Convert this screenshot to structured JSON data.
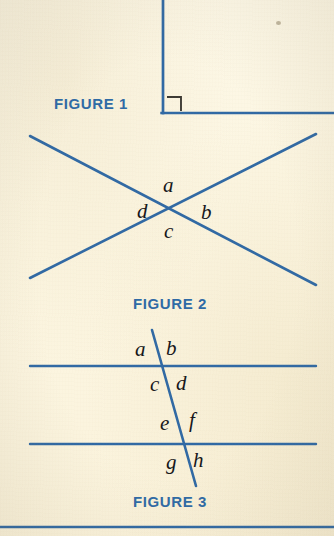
{
  "page": {
    "background_color": "#fdf7e4",
    "ink_color": "#2e6aa6",
    "label_color": "#15161a",
    "right_angle_mark_color": "#3c3a34"
  },
  "figures": [
    {
      "id": "figure-1",
      "caption": "FIGURE 1",
      "description": "A vertical ray meeting a horizontal ray at a right angle, marked with a small square.",
      "caption_position": {
        "x": 54,
        "y": 95
      },
      "elements": {
        "vertical_line": {
          "x1": 163,
          "y1": 0,
          "x2": 163,
          "y2": 113
        },
        "horizontal_line": {
          "x1": 163,
          "y1": 113,
          "x2": 334,
          "y2": 113
        },
        "right_angle_mark": {
          "x": 167,
          "y": 96,
          "size": 14
        }
      },
      "angle_labels": []
    },
    {
      "id": "figure-2",
      "caption": "FIGURE 2",
      "description": "Two straight lines crossing at a point, forming four angles labelled a, b, c and d.",
      "caption_position": {
        "x": 172,
        "y": 303
      },
      "elements": {
        "line_1": {
          "x1": 30,
          "y1": 136,
          "x2": 316,
          "y2": 285
        },
        "line_2": {
          "x1": 30,
          "y1": 278,
          "x2": 316,
          "y2": 134
        },
        "intersection": {
          "x": 172,
          "y": 211
        }
      },
      "angle_labels": [
        {
          "text": "a",
          "x": 168,
          "y": 186
        },
        {
          "text": "b",
          "x": 206,
          "y": 213
        },
        {
          "text": "c",
          "x": 169,
          "y": 232
        },
        {
          "text": "d",
          "x": 143,
          "y": 212
        }
      ]
    },
    {
      "id": "figure-3",
      "caption": "FIGURE 3",
      "description": "Two parallel lines cut by a transversal, forming eight angles labelled a through h.",
      "caption_position": {
        "x": 172,
        "y": 501
      },
      "elements": {
        "parallel_line_top": {
          "x1": 30,
          "y1": 366,
          "x2": 316,
          "y2": 366
        },
        "parallel_line_bottom": {
          "x1": 30,
          "y1": 444,
          "x2": 316,
          "y2": 444
        },
        "transversal": {
          "x1": 152,
          "y1": 330,
          "x2": 196,
          "y2": 486
        }
      },
      "angle_labels": [
        {
          "text": "a",
          "x": 141,
          "y": 350
        },
        {
          "text": "b",
          "x": 171,
          "y": 349
        },
        {
          "text": "c",
          "x": 156,
          "y": 385
        },
        {
          "text": "d",
          "x": 181,
          "y": 384
        },
        {
          "text": "e",
          "x": 165,
          "y": 423
        },
        {
          "text": "f",
          "x": 192,
          "y": 421
        },
        {
          "text": "g",
          "x": 172,
          "y": 463
        },
        {
          "text": "h",
          "x": 198,
          "y": 461
        }
      ]
    }
  ],
  "rules": [
    {
      "id": "bottom-rule",
      "x1": 0,
      "y1": 527,
      "x2": 334,
      "y2": 527
    }
  ],
  "artifacts": [
    {
      "id": "paper-speck",
      "x": 276,
      "y": 21
    }
  ]
}
